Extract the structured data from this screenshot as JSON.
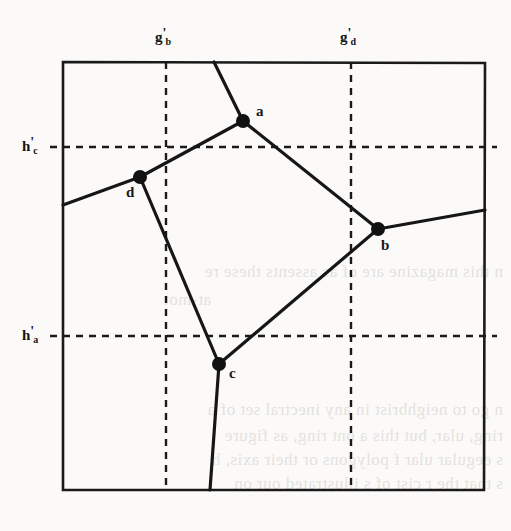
{
  "figure": {
    "kind": "geometric-diagram",
    "box": {
      "x0": 63,
      "y0": 62,
      "x1": 485,
      "y1": 490,
      "stroke": "#1a1a1a",
      "stroke_width": 2.6
    },
    "grid_lines": [
      {
        "name": "g_b_prime",
        "orientation": "vertical",
        "pos": 166,
        "label": "g",
        "sub": "b",
        "prime": "'",
        "label_x": 156,
        "label_y": 30
      },
      {
        "name": "g_d_prime",
        "orientation": "vertical",
        "pos": 351,
        "label": "g",
        "sub": "d",
        "prime": "'",
        "label_x": 341,
        "label_y": 30
      },
      {
        "name": "h_c_prime",
        "orientation": "horizontal",
        "pos": 147,
        "label": "h",
        "sub": "c",
        "prime": "'",
        "label_x": 22,
        "label_y": 138
      },
      {
        "name": "h_a_prime",
        "orientation": "horizontal",
        "pos": 336,
        "label": "h",
        "sub": "a",
        "prime": "'",
        "label_x": 22,
        "label_y": 327
      }
    ],
    "vertices": [
      {
        "name": "a",
        "label": "a",
        "x": 243,
        "y": 121,
        "label_x": 256,
        "label_y": 104,
        "r": 7
      },
      {
        "name": "b",
        "label": "b",
        "x": 378,
        "y": 229,
        "label_x": 381,
        "label_y": 238,
        "r": 7
      },
      {
        "name": "c",
        "label": "c",
        "x": 219,
        "y": 364,
        "label_x": 229,
        "label_y": 366,
        "r": 7
      },
      {
        "name": "d",
        "label": "d",
        "x": 140,
        "y": 177,
        "label_x": 126,
        "label_y": 185,
        "r": 7
      }
    ],
    "edges": [
      {
        "name": "edge-a-top",
        "from": [
          243,
          121
        ],
        "to": [
          214,
          62
        ]
      },
      {
        "name": "edge-a-d",
        "from": [
          243,
          121
        ],
        "to": [
          140,
          177
        ]
      },
      {
        "name": "edge-a-b",
        "from": [
          243,
          121
        ],
        "to": [
          378,
          229
        ]
      },
      {
        "name": "edge-d-left",
        "from": [
          140,
          177
        ],
        "to": [
          63,
          205
        ]
      },
      {
        "name": "edge-d-c",
        "from": [
          140,
          177
        ],
        "to": [
          219,
          364
        ]
      },
      {
        "name": "edge-b-right",
        "from": [
          378,
          229
        ],
        "to": [
          485,
          210
        ]
      },
      {
        "name": "edge-b-c",
        "from": [
          378,
          229
        ],
        "to": [
          219,
          364
        ]
      },
      {
        "name": "edge-c-bottom",
        "from": [
          219,
          364
        ],
        "to": [
          210,
          490
        ]
      }
    ],
    "style": {
      "edge_stroke": "#161616",
      "edge_width": 3.2,
      "dash_stroke": "#1a1a1a",
      "dash_width": 2.4,
      "dash_pattern": "7,6",
      "vertex_fill": "#111111"
    }
  },
  "background_text": {
    "note": "faint mirrored bleed-through from reverse side of the scanned page",
    "lines": [
      {
        "text": "n this magazine are of as assents these re",
        "x": 8,
        "y": 268
      },
      {
        "text": "at-mot",
        "x": 8,
        "y": 296
      },
      {
        "text": "n go to neighbrist in any inectral set of a",
        "x": 8,
        "y": 406
      },
      {
        "text": "ring, ular, but this a ont ring, as figure",
        "x": 8,
        "y": 432
      },
      {
        "text": "s eegular ular f polygons or their axis, h",
        "x": 8,
        "y": 456
      },
      {
        "text": "s that the r cist of s illustrated our on",
        "x": 8,
        "y": 480
      }
    ]
  }
}
